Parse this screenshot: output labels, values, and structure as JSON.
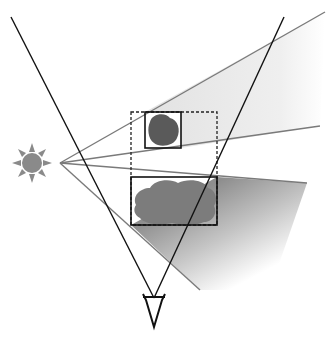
{
  "diagram": {
    "title": "",
    "colors": {
      "line_dark": "#111111",
      "ray_gray": "#7a7a7a",
      "sun_fill": "#8a8a8a",
      "object_small": "#5a5a5a",
      "object_large": "#7c7c7c",
      "shadow_light": "#e6e6e6",
      "shadow_dark": "#9a9a9a"
    },
    "elements": {
      "light_source": {
        "label": "sun-icon",
        "x": 32,
        "y": 163
      },
      "eye": {
        "label": "eye-symbol",
        "x": 152,
        "y": 312
      },
      "small_object": {
        "label": "small object",
        "box": [
          145,
          112,
          36,
          36
        ]
      },
      "large_object": {
        "label": "large object",
        "box": [
          131,
          177,
          86,
          48
        ]
      },
      "bounding_box": {
        "label": "dashed combined bounds",
        "box": [
          131,
          112,
          86,
          113
        ]
      }
    }
  }
}
